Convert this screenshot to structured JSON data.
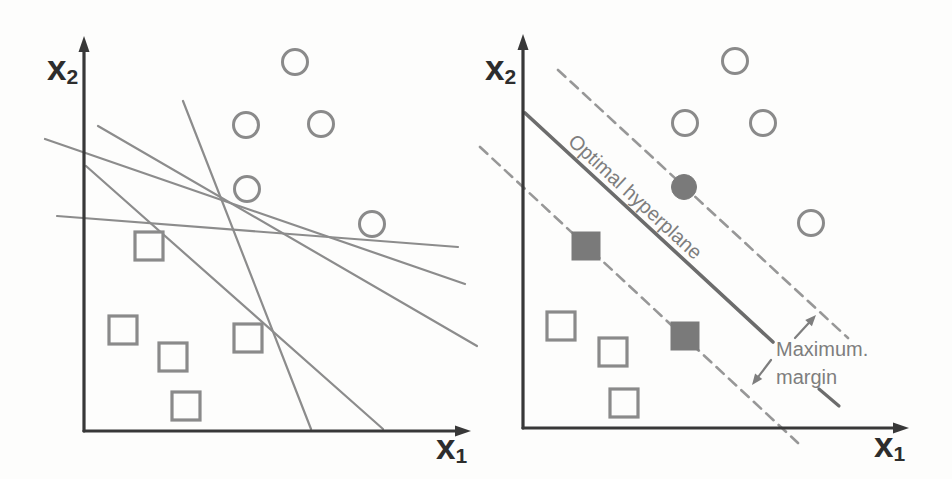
{
  "figure": {
    "width": 952,
    "height": 479,
    "background": "#fdfdfc",
    "colors": {
      "axis": "#383838",
      "axis_label": "#2d2d2d",
      "candidate_line": "#8c8c8c",
      "shape_outline": "#8a8a8a",
      "shape_fill": "#fdfdfc",
      "support_fill": "#7a7a7a",
      "hyperplane_line": "#6c6c6c",
      "margin_dash": "#979797",
      "annotation_text": "#7e7e7e"
    }
  },
  "left_panel": {
    "y_axis": {
      "x": 84,
      "top": 36,
      "bottom": 431,
      "label_base": "x",
      "label_sub": "2",
      "label_x": 47,
      "label_y": 80
    },
    "x_axis": {
      "y": 431,
      "left": 84,
      "right": 471,
      "label_base": "x",
      "label_sub": "1",
      "label_x": 436,
      "label_y": 459
    },
    "candidate_lines": [
      [
        183,
        101,
        311,
        429
      ],
      [
        98,
        126,
        477,
        346
      ],
      [
        45,
        139,
        465,
        284
      ],
      [
        86,
        166,
        383,
        429
      ],
      [
        57,
        216,
        458,
        247
      ]
    ],
    "circles": [
      [
        295,
        62
      ],
      [
        246,
        125
      ],
      [
        321,
        124
      ],
      [
        247,
        189
      ],
      [
        372,
        224
      ]
    ],
    "squares": [
      [
        149,
        246
      ],
      [
        123,
        330
      ],
      [
        173,
        357
      ],
      [
        248,
        338
      ],
      [
        186,
        406
      ]
    ]
  },
  "right_panel": {
    "y_axis": {
      "x": 523,
      "top": 34,
      "bottom": 428,
      "label_base": "x",
      "label_sub": "2",
      "label_x": 485,
      "label_y": 80
    },
    "x_axis": {
      "y": 428,
      "left": 523,
      "right": 909,
      "label_base": "x",
      "label_sub": "1",
      "label_x": 874,
      "label_y": 457
    },
    "open_circles": [
      [
        735,
        61
      ],
      [
        685,
        123
      ],
      [
        763,
        123
      ],
      [
        811,
        223
      ]
    ],
    "filled_circles": [
      [
        684,
        187
      ]
    ],
    "open_squares": [
      [
        561,
        326
      ],
      [
        613,
        352
      ],
      [
        624,
        403
      ]
    ],
    "filled_squares": [
      [
        586,
        246
      ],
      [
        685,
        336
      ]
    ],
    "hyperplane": {
      "x1": 525,
      "y1": 113,
      "x2": 773,
      "y2": 342,
      "label": "Optimal hyperplane",
      "label_x": 567,
      "label_y": 143,
      "label_angle": 42.7,
      "extension_dash": [
        819,
        389,
        839,
        406
      ]
    },
    "margin_upper": [
      558,
      70,
      848,
      338
    ],
    "margin_lower": [
      480,
      147,
      798,
      443
    ],
    "margin_label": {
      "line1": "Maximum.",
      "line2": "margin",
      "x": 776,
      "y1": 356,
      "y2": 384
    },
    "margin_arrows": [
      [
        795,
        338,
        816,
        315
      ],
      [
        771,
        360,
        752,
        385
      ]
    ]
  },
  "shape_metrics": {
    "circle_radius": 12.5,
    "square_size": 28,
    "circle_stroke": 3,
    "square_stroke": 3.2,
    "candidate_line_width": 2.2,
    "hyperplane_width": 3.6,
    "dash_width": 2.6,
    "dash_pattern": "10 7",
    "axis_width": 3.2
  }
}
